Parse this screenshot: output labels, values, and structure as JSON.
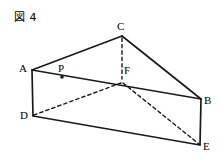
{
  "figure": {
    "caption": "図 4",
    "shape_name": "triangular-prism",
    "stroke_color": "#1a1a1a",
    "background_color": "#ffffff",
    "width": 221,
    "height": 163
  },
  "vertices": [
    {
      "id": "A",
      "label": "A",
      "x": 32,
      "y": 70,
      "label_x": 19,
      "label_y": 63,
      "hidden": false,
      "dot": false
    },
    {
      "id": "B",
      "label": "B",
      "x": 201,
      "y": 99,
      "label_x": 204,
      "label_y": 95,
      "hidden": false,
      "dot": false
    },
    {
      "id": "C",
      "label": "C",
      "x": 122,
      "y": 36,
      "label_x": 117,
      "label_y": 21,
      "hidden": false,
      "dot": false
    },
    {
      "id": "D",
      "label": "D",
      "x": 33,
      "y": 116,
      "label_x": 20,
      "label_y": 110,
      "hidden": false,
      "dot": false
    },
    {
      "id": "E",
      "label": "E",
      "x": 200,
      "y": 145,
      "label_x": 203,
      "label_y": 141,
      "hidden": false,
      "dot": false
    },
    {
      "id": "F",
      "label": "F",
      "x": 122,
      "y": 80,
      "label_x": 124,
      "label_y": 65,
      "hidden": true,
      "dot": false
    },
    {
      "id": "P",
      "label": "P",
      "x": 62,
      "y": 77,
      "label_x": 58,
      "label_y": 63,
      "hidden": false,
      "dot": true
    }
  ],
  "edges": [
    {
      "id": "AC",
      "from": "A",
      "to": "C",
      "style": "solid",
      "x1": 32,
      "y1": 70,
      "x2": 122,
      "y2": 36
    },
    {
      "id": "CB",
      "from": "C",
      "to": "B",
      "style": "solid",
      "x1": 122,
      "y1": 36,
      "x2": 201,
      "y2": 99
    },
    {
      "id": "AB",
      "from": "A",
      "to": "B",
      "style": "solid",
      "x1": 32,
      "y1": 70,
      "x2": 201,
      "y2": 99
    },
    {
      "id": "AD",
      "from": "A",
      "to": "D",
      "style": "solid",
      "x1": 32,
      "y1": 70,
      "x2": 33,
      "y2": 116
    },
    {
      "id": "BE",
      "from": "B",
      "to": "E",
      "style": "solid",
      "x1": 201,
      "y1": 99,
      "x2": 200,
      "y2": 145
    },
    {
      "id": "DE",
      "from": "D",
      "to": "E",
      "style": "solid",
      "x1": 33,
      "y1": 116,
      "x2": 200,
      "y2": 145
    },
    {
      "id": "CF",
      "from": "C",
      "to": "F",
      "style": "dashed",
      "x1": 122,
      "y1": 38,
      "x2": 122,
      "y2": 79
    },
    {
      "id": "FD",
      "from": "F",
      "to": "D",
      "style": "dashed",
      "x1": 121,
      "y1": 83,
      "x2": 34,
      "y2": 115
    },
    {
      "id": "FE",
      "from": "F",
      "to": "E",
      "style": "dashed",
      "x1": 123,
      "y1": 83,
      "x2": 199,
      "y2": 144
    }
  ],
  "markers": {
    "point_p_radius": 1.8
  }
}
